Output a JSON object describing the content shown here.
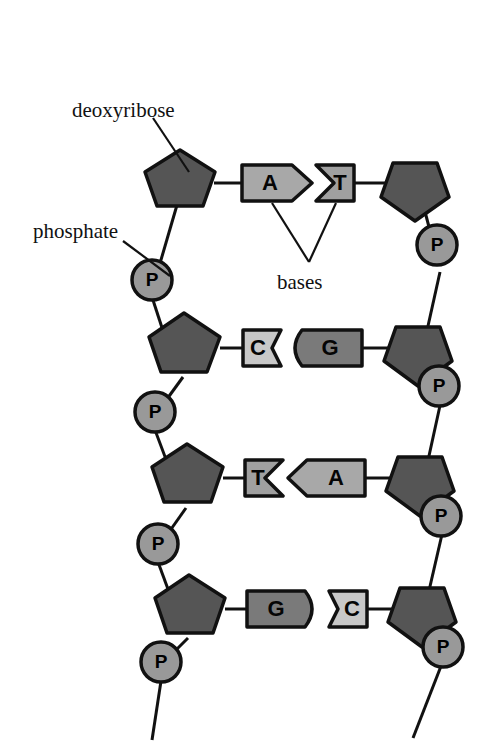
{
  "figure": {
    "background_color": "#ffffff"
  },
  "colors": {
    "outline": "#111111",
    "deoxyribose_fill": "#555555",
    "phosphate_fill": "#999999",
    "base_A_fill": "#a8a8a8",
    "base_T_fill": "#a0a0a0",
    "base_G_fill": "#7a7a7a",
    "base_C_fill": "#c8c8c8",
    "text_color": "#111111"
  },
  "labels": {
    "deoxyribose": "deoxyribose",
    "phosphate": "phosphate",
    "bases": "bases"
  },
  "phosphate_letter": "P",
  "base_pairs": [
    {
      "left": "A",
      "right": "T",
      "left_shape": "arrow-right",
      "right_shape": "notch-left"
    },
    {
      "left": "C",
      "right": "G",
      "left_shape": "concave-right",
      "right_shape": "round-left"
    },
    {
      "left": "T",
      "right": "A",
      "left_shape": "notch-right",
      "right_shape": "chevron-left"
    },
    {
      "left": "G",
      "right": "C",
      "left_shape": "round-right",
      "right_shape": "concave-left"
    }
  ],
  "strands": {
    "left": {
      "name": "left-strand",
      "sugar_count": 4,
      "phosphate_count": 4
    },
    "right": {
      "name": "right-strand",
      "sugar_count": 4,
      "phosphate_count": 4
    }
  }
}
